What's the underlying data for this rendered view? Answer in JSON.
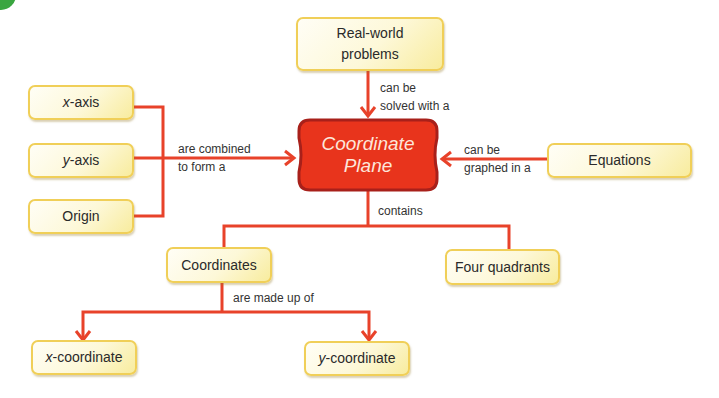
{
  "diagram": {
    "type": "concept-map",
    "colors": {
      "connector": "#e8422a",
      "center_fill": "#e8341c",
      "center_border": "#a8201a",
      "node_border": "#f0cf58",
      "node_fill": "#fdf8d8",
      "corner_badge": "#3aa640"
    },
    "center": {
      "line1": "Coordinate",
      "line2": "Plane"
    },
    "nodes": {
      "x_axis": {
        "var": "x",
        "rest": "-axis"
      },
      "y_axis": {
        "var": "y",
        "rest": "-axis"
      },
      "origin": "Origin",
      "real_world": {
        "line1": "Real-world",
        "line2": "problems"
      },
      "equations": "Equations",
      "coordinates": "Coordinates",
      "four_quadrants": "Four quadrants",
      "x_coordinate": {
        "var": "x",
        "rest": "-coordinate"
      },
      "y_coordinate": {
        "var": "y",
        "rest": "-coordinate"
      }
    },
    "edges": {
      "combined": {
        "line1": "are combined",
        "line2": "to form a"
      },
      "solved": {
        "line1": "can be",
        "line2": "solved with a"
      },
      "graphed": {
        "line1": "can be",
        "line2": "graphed in a"
      },
      "contains": "contains",
      "made_up": "are made up of"
    }
  }
}
